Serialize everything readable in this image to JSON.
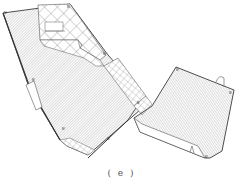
{
  "figure": {
    "caption": "( e )",
    "type": "architectural floor plan",
    "colors": {
      "stroke": "#3a3a3a",
      "hatch": "#9a9a9a",
      "crosshatch": "#8a8a8a",
      "background": "#ffffff"
    },
    "regions": [
      {
        "name": "left-block",
        "fill": "diagonal-hatch"
      },
      {
        "name": "courtyard-crosshatch",
        "fill": "crosshatch"
      },
      {
        "name": "connector-stair",
        "fill": "grid"
      },
      {
        "name": "right-block",
        "fill": "diagonal-hatch"
      }
    ]
  }
}
